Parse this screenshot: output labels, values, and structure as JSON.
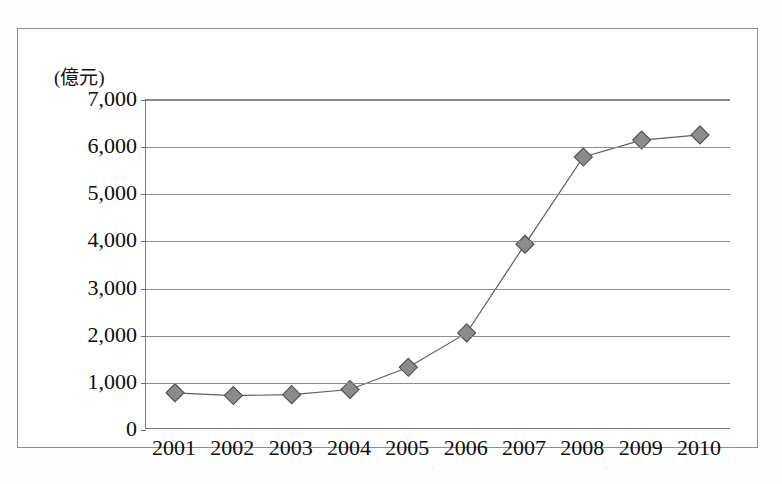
{
  "chart_data": {
    "type": "line",
    "title": "",
    "subtitle": "",
    "xlabel": "(年)",
    "ylabel": "(億元)",
    "y_unit_label": "(億元)",
    "x_unit_label": "(年)",
    "categories": [
      "2001",
      "2002",
      "2003",
      "2004",
      "2005",
      "2006",
      "2007",
      "2008",
      "2009",
      "2010"
    ],
    "values": [
      790,
      730,
      750,
      860,
      1330,
      2060,
      3940,
      5790,
      6150,
      6260
    ],
    "series": [
      {
        "name": "",
        "values": [
          790,
          730,
          750,
          860,
          1330,
          2060,
          3940,
          5790,
          6150,
          6260
        ],
        "marker": "diamond",
        "marker_color": "#8b8b8b",
        "marker_edge_color": "#4e4e4e",
        "line_color": "#5f5f5f"
      }
    ],
    "ylim": [
      0,
      7000
    ],
    "y_ticks": [
      0,
      1000,
      2000,
      3000,
      4000,
      5000,
      6000,
      7000
    ],
    "y_tick_labels": [
      "0",
      "1,000",
      "2,000",
      "3,000",
      "4,000",
      "5,000",
      "6,000",
      "7,000"
    ],
    "grid": true,
    "grid_axis": "y",
    "legend": false,
    "legend_position": "none",
    "annotations": []
  },
  "colors": {
    "marker_fill": "#8b8b8b",
    "marker_edge": "#4e4e4e",
    "line": "#5f5f5f",
    "grid": "#8d8d8d",
    "axis": "#7d7d7d",
    "frame": "#8f8f8f",
    "text": "#0d0d0d",
    "background": "#ffffff"
  }
}
